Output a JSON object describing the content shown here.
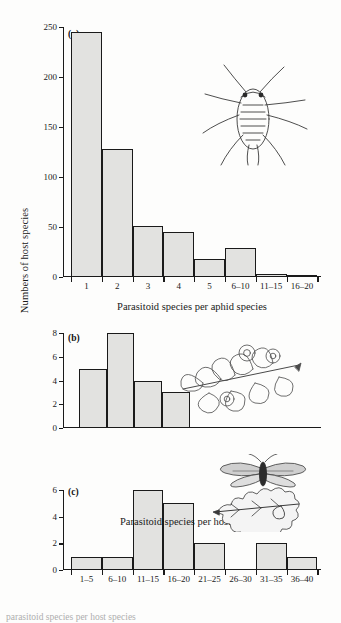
{
  "figure": {
    "y_axis_label": "Numbers of host species",
    "background_color": "#fdfdfc",
    "bar_fill_color": "#e2e2e0",
    "bar_edge_color": "#1a1a1a",
    "cropped_caption": "parasitoid species per host species"
  },
  "chart_data": [
    {
      "type": "bar",
      "panel": "(a)",
      "title": "",
      "xlabel": "Parasitoid species per aphid species",
      "ylabel": "Numbers of host species",
      "categories": [
        "1",
        "2",
        "3",
        "4",
        "5",
        "6–10",
        "11–15",
        "16–20"
      ],
      "values": [
        245,
        128,
        51,
        45,
        18,
        29,
        3,
        1
      ],
      "ylim": [
        0,
        250
      ],
      "yticks": [
        0,
        50,
        100,
        150,
        200,
        250
      ],
      "ytick_labels": [
        "0",
        "50",
        "100",
        "150",
        "200",
        "250"
      ],
      "grid": false,
      "legend": "none",
      "annotation_art": "aphid-drawing"
    },
    {
      "type": "bar",
      "panel": "(b)",
      "title": "",
      "xlabel": "",
      "ylabel": "Numbers of host species",
      "categories": [
        "",
        "",
        "",
        ""
      ],
      "values": [
        5,
        8,
        4,
        3
      ],
      "ylim": [
        0,
        8
      ],
      "yticks": [
        0,
        2,
        4,
        6,
        8
      ],
      "ytick_labels": [
        "0",
        "2",
        "4",
        "6",
        "8"
      ],
      "grid": false,
      "legend": "none",
      "annotation_art": "gall-leaf-drawing"
    },
    {
      "type": "bar",
      "panel": "(c)",
      "title": "",
      "xlabel": "Parasitoid species per host species",
      "ylabel": "Numbers of host species",
      "categories": [
        "1–5",
        "6–10",
        "11–15",
        "16–20",
        "21–25",
        "26–30",
        "31–35",
        "36–40"
      ],
      "values": [
        1,
        1,
        6,
        5,
        2,
        0,
        2,
        1
      ],
      "ylim": [
        0,
        6
      ],
      "yticks": [
        0,
        2,
        4,
        6
      ],
      "ytick_labels": [
        "0",
        "2",
        "4",
        "6"
      ],
      "grid": false,
      "legend": "none",
      "annotation_art": "leafminer-moth-and-oak-leaf-drawing"
    }
  ]
}
